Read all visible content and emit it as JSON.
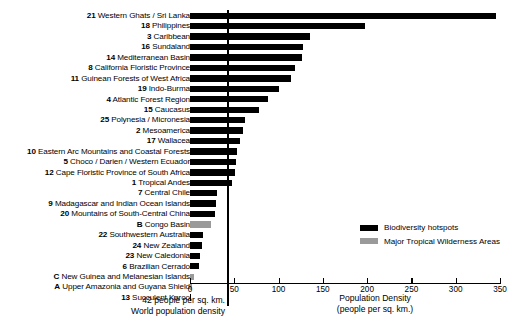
{
  "chart_data": {
    "type": "bar",
    "orientation": "horizontal",
    "title": "",
    "xlabel": "Population Density\n(people per sq. km.)",
    "ylabel": "",
    "xlim": [
      0,
      350
    ],
    "xticks": [
      0,
      50,
      100,
      150,
      200,
      250,
      300,
      350
    ],
    "grid": false,
    "legend_position": "right-middle",
    "reference_line": {
      "value": 42,
      "label_line1": "42 people per sq. km.",
      "label_line2": "World population density"
    },
    "series": [
      {
        "name": "Biodiversity hotspots",
        "color": "#000000"
      },
      {
        "name": "Major Tropical Wilderness Areas",
        "color": "#9a9a9a"
      }
    ],
    "categories": [
      "Western Ghats / Sri Lanka",
      "Philippines",
      "Caribbean",
      "Sundaland",
      "Mediterranean Basin",
      "California Floristic Province",
      "Guinean Forests of West Africa",
      "Indo-Burma",
      "Atlantic Forest Region",
      "Caucasus",
      "Polynesia / Micronesia",
      "Mesoamerica",
      "Wallacea",
      "Eastern Arc Mountains and Coastal Forests",
      "Choco / Darien / Western Ecuador",
      "Cape Floristic Province of South Africa",
      "Tropical Andes",
      "Central Chile",
      "Madagascar and Indian Ocean Islands",
      "Mountains of South-Central China",
      "Congo Basin",
      "Southwestern Australia",
      "New Zealand",
      "New Caledonia",
      "Brazilian Cerrado",
      "New Guinea and Melanesian Islands",
      "Upper Amazonia and Guyana Shield",
      "Succulent Karoo"
    ],
    "codes": [
      "21",
      "18",
      "3",
      "16",
      "14",
      "8",
      "11",
      "19",
      "4",
      "15",
      "25",
      "2",
      "17",
      "10",
      "5",
      "12",
      "1",
      "7",
      "9",
      "20",
      "B",
      "22",
      "24",
      "23",
      "6",
      "C",
      "A",
      "13"
    ],
    "values": [
      346,
      198,
      135,
      128,
      127,
      118,
      114,
      100,
      88,
      78,
      62,
      60,
      56,
      53,
      52,
      51,
      47,
      30,
      29,
      28,
      24,
      15,
      13,
      11,
      10,
      5,
      2,
      1
    ],
    "series_of_bar": [
      "hotspot",
      "hotspot",
      "hotspot",
      "hotspot",
      "hotspot",
      "hotspot",
      "hotspot",
      "hotspot",
      "hotspot",
      "hotspot",
      "hotspot",
      "hotspot",
      "hotspot",
      "hotspot",
      "hotspot",
      "hotspot",
      "hotspot",
      "hotspot",
      "hotspot",
      "hotspot",
      "wilderness",
      "hotspot",
      "hotspot",
      "hotspot",
      "hotspot",
      "wilderness",
      "wilderness",
      "hotspot"
    ]
  },
  "legend": {
    "items": [
      {
        "label": "Biodiversity hotspots",
        "swatch": "black"
      },
      {
        "label": "Major Tropical Wilderness Areas",
        "swatch": "gray"
      }
    ]
  },
  "axis": {
    "title_line1": "Population Density",
    "title_line2": "(people per sq. km.)"
  },
  "annotation": {
    "line1": "42 people per sq. km.",
    "line2": "World population density"
  }
}
